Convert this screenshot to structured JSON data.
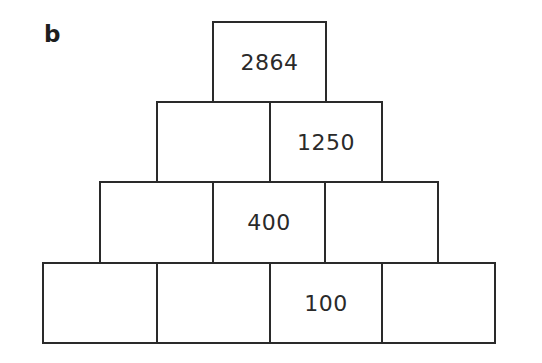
{
  "label": "b",
  "pyramid": {
    "rows": [
      [
        "2864"
      ],
      [
        "",
        "1250"
      ],
      [
        "",
        "400",
        ""
      ],
      [
        "",
        "",
        "100",
        ""
      ]
    ]
  },
  "colors": {
    "line": "#2a2a2a",
    "background": "#ffffff",
    "text": "#2a2a2a"
  }
}
